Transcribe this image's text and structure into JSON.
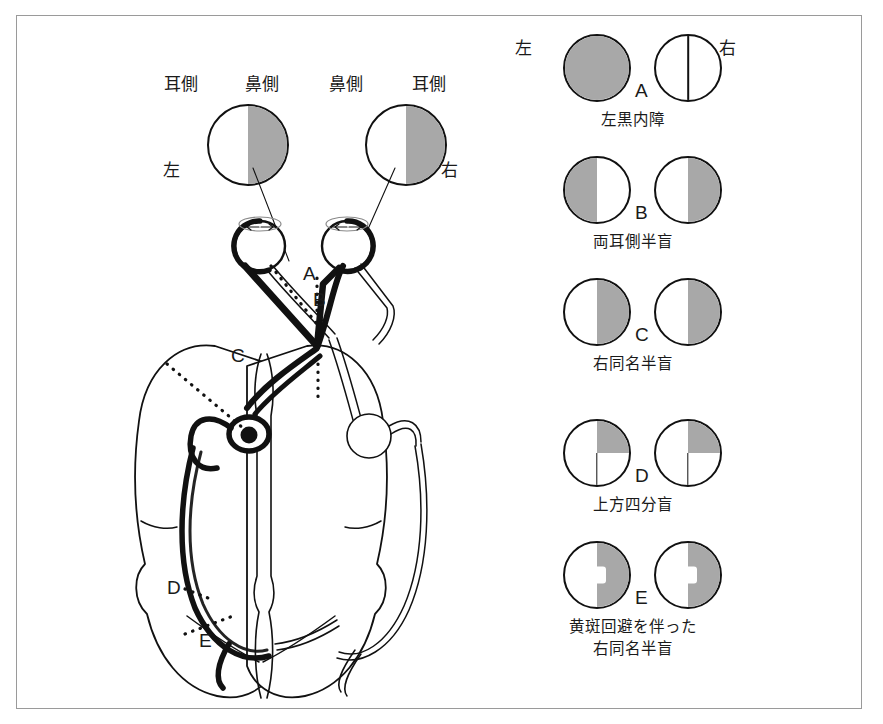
{
  "figure": {
    "colors": {
      "shade_gray": "#a8a8a8",
      "outline_black": "#111111",
      "frame_gray": "#9a9a9a",
      "background": "#ffffff"
    }
  },
  "pathway_panel": {
    "field_labels": {
      "left_temporal": "耳側",
      "left_nasal": "鼻側",
      "right_nasal": "鼻側",
      "right_temporal": "耳側",
      "left_eye": "左",
      "right_eye": "右"
    },
    "lesion_markers": [
      {
        "id": "A",
        "label": "A",
        "site": "optic-nerve"
      },
      {
        "id": "B",
        "label": "B",
        "site": "optic-chiasm"
      },
      {
        "id": "C",
        "label": "C",
        "site": "optic-tract"
      },
      {
        "id": "D",
        "label": "D",
        "site": "optic-radiation-temporal-loop"
      },
      {
        "id": "E",
        "label": "E",
        "site": "occipital-cortex"
      }
    ]
  },
  "legend_panel": {
    "header_left": "左",
    "header_right": "右",
    "rows": [
      {
        "letter": "A",
        "caption": "左黒内障",
        "left_eye": {
          "pattern": "full",
          "midline": false,
          "macular_sparing": false
        },
        "right_eye": {
          "pattern": "none",
          "midline": true,
          "macular_sparing": false
        }
      },
      {
        "letter": "B",
        "caption": "両耳側半盲",
        "left_eye": {
          "pattern": "left-half",
          "midline": false,
          "macular_sparing": false
        },
        "right_eye": {
          "pattern": "right-half",
          "midline": false,
          "macular_sparing": false
        }
      },
      {
        "letter": "C",
        "caption": "右同名半盲",
        "left_eye": {
          "pattern": "right-half",
          "midline": false,
          "macular_sparing": false
        },
        "right_eye": {
          "pattern": "right-half",
          "midline": false,
          "macular_sparing": false
        }
      },
      {
        "letter": "D",
        "caption": "上方四分盲",
        "left_eye": {
          "pattern": "upper-right-quadrant",
          "midline": "lower",
          "macular_sparing": false
        },
        "right_eye": {
          "pattern": "upper-right-quadrant",
          "midline": "lower",
          "macular_sparing": false
        }
      },
      {
        "letter": "E",
        "caption": "黄斑回避を伴った\n右同名半盲",
        "caption_line1": "黄斑回避を伴った",
        "caption_line2": "右同名半盲",
        "left_eye": {
          "pattern": "right-half",
          "midline": false,
          "macular_sparing": true
        },
        "right_eye": {
          "pattern": "right-half",
          "midline": false,
          "macular_sparing": true
        }
      }
    ]
  }
}
